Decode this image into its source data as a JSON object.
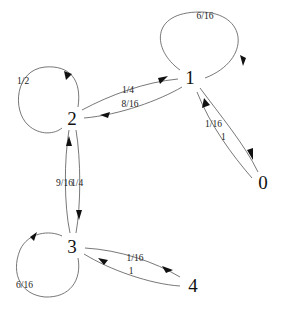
{
  "diagram": {
    "type": "state-transition-graph",
    "nodes": [
      {
        "id": "0",
        "label": "0"
      },
      {
        "id": "1",
        "label": "1"
      },
      {
        "id": "2",
        "label": "2"
      },
      {
        "id": "3",
        "label": "3"
      },
      {
        "id": "4",
        "label": "4"
      }
    ],
    "edges": [
      {
        "from": "1",
        "to": "1",
        "label": "6/16"
      },
      {
        "from": "1",
        "to": "0",
        "label": "1/16"
      },
      {
        "from": "0",
        "to": "1",
        "label": "1"
      },
      {
        "from": "2",
        "to": "1",
        "label": "1/4"
      },
      {
        "from": "1",
        "to": "2",
        "label": "8/16"
      },
      {
        "from": "2",
        "to": "2",
        "label": "1/2"
      },
      {
        "from": "3",
        "to": "2",
        "label": "9/16"
      },
      {
        "from": "2",
        "to": "3",
        "label": "1/4"
      },
      {
        "from": "3",
        "to": "3",
        "label": "6/16"
      },
      {
        "from": "3",
        "to": "4",
        "label": "1/16"
      },
      {
        "from": "4",
        "to": "3",
        "label": "1"
      }
    ]
  }
}
